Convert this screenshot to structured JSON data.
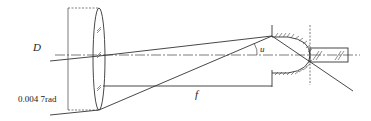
{
  "diagram": {
    "type": "optical-schematic",
    "labels": {
      "diameter": "D",
      "angle_rad": "0.004 7rad",
      "focal_length": "f",
      "half_angle": "u"
    },
    "colors": {
      "line": "#333333",
      "background": "#ffffff"
    }
  }
}
